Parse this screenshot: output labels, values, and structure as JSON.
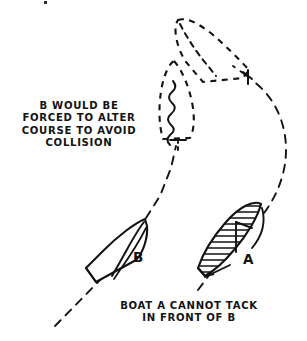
{
  "diagram": {
    "title": "Boat A cannot tack in front of B",
    "style": "hand-drawn pen and ink sailing rules illustration",
    "background_color": "#ffffff",
    "ink_color": "#131313",
    "annotations": {
      "left_note": "B WOULD BE\nFORCED TO ALTER\nCOURSE TO AVOID\nCOLLISION",
      "bottom_note": "BOAT A CANNOT TACK\nIN FRONT OF B"
    },
    "boats": [
      {
        "id": "boat-b-solid",
        "label": "B",
        "state": "current",
        "fill": "none",
        "outline": "solid",
        "heading": "up-right",
        "position": {
          "x": 116,
          "y": 248
        }
      },
      {
        "id": "boat-a-solid",
        "label": "A",
        "state": "current",
        "fill": "hatched",
        "outline": "solid",
        "heading": "up-right",
        "position": {
          "x": 232,
          "y": 239
        }
      },
      {
        "id": "boat-b-ghost",
        "label": "",
        "state": "projected",
        "fill": "none",
        "outline": "dashed",
        "heading": "up",
        "position": {
          "x": 176,
          "y": 100
        }
      },
      {
        "id": "boat-a-ghost",
        "label": "",
        "state": "projected",
        "fill": "none",
        "outline": "dashed",
        "heading": "up-left",
        "position": {
          "x": 212,
          "y": 50
        }
      }
    ],
    "tracks": [
      {
        "id": "track-b",
        "belongs_to": "B",
        "shape": "straight",
        "style": "dashed"
      },
      {
        "id": "track-a",
        "belongs_to": "A",
        "shape": "curved-tack",
        "style": "dashed"
      }
    ]
  }
}
